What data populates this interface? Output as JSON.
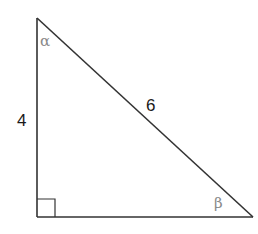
{
  "diagram": {
    "type": "right-triangle",
    "vertices": {
      "top": [
        37,
        18
      ],
      "right_angle": [
        37,
        217
      ],
      "bottom_right": [
        253,
        217
      ]
    },
    "right_angle_marker_size": 18,
    "stroke_color": "#333333",
    "angle_label_color": "#8a8a8a",
    "side_label_color": "#1a1a1a",
    "labels": {
      "vertical_side": "4",
      "hypotenuse": "6",
      "angle_top": "α",
      "angle_bottom_right": "β"
    }
  }
}
